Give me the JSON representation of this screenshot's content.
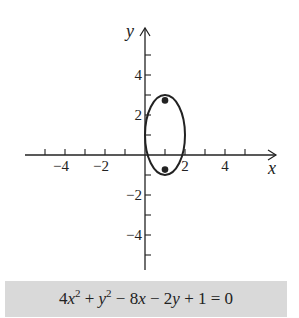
{
  "chart_data": {
    "type": "line",
    "title": "",
    "xlabel": "x",
    "ylabel": "y",
    "xlim": [
      -5,
      6
    ],
    "ylim": [
      -6,
      6
    ],
    "x_ticks": [
      -5,
      -4,
      -3,
      -2,
      -1,
      1,
      2,
      3,
      4,
      5
    ],
    "x_tick_labels": [
      "-4",
      "-2",
      "2",
      "4"
    ],
    "x_tick_label_values": [
      -4,
      -2,
      2,
      4
    ],
    "y_ticks": [
      -5,
      -4,
      -3,
      -2,
      -1,
      1,
      2,
      3,
      4,
      5
    ],
    "y_tick_labels": [
      "4",
      "2",
      "-2",
      "-4"
    ],
    "y_tick_label_values": [
      4,
      2,
      -2,
      -4
    ],
    "grid": false,
    "series": [
      {
        "name": "ellipse",
        "kind": "ellipse",
        "center": [
          1,
          1
        ],
        "semi_axis_x": 1,
        "semi_axis_y": 2,
        "x_range": [
          0,
          2
        ],
        "y_range": [
          -1,
          3
        ]
      },
      {
        "name": "foci",
        "kind": "points",
        "points": [
          [
            1,
            2.73
          ],
          [
            1,
            -0.73
          ]
        ]
      }
    ],
    "annotation": "4x^2 + y^2 - 8x - 2y + 1 = 0"
  },
  "equation": {
    "coef_a": "4",
    "var_x": "x",
    "exp_x": "2",
    "plus1": " + ",
    "var_y": "y",
    "exp_y": "2",
    "minus1": " − 8",
    "var_x2": "x",
    "minus2": " − 2",
    "var_y2": "y",
    "tail": " + 1 = 0"
  },
  "colors": {
    "ink": "#222222",
    "equation_bg": "#d9d9d9"
  }
}
